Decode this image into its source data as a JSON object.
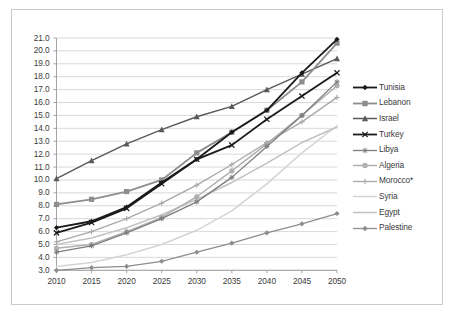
{
  "chart_data": {
    "type": "line",
    "title": "",
    "xlabel": "",
    "ylabel": "",
    "x": [
      2010,
      2015,
      2020,
      2025,
      2030,
      2035,
      2040,
      2045,
      2050
    ],
    "xtick_labels": [
      "2010",
      "2015",
      "2020",
      "2025",
      "2030",
      "2035",
      "2040",
      "2045",
      "2050"
    ],
    "ytick_labels": [
      "3.0",
      "4.0",
      "5.0",
      "6.0",
      "7.0",
      "8.0",
      "9.0",
      "10.0",
      "11.0",
      "12.0",
      "13.0",
      "14.0",
      "15.0",
      "16.0",
      "17.0",
      "18.0",
      "19.0",
      "20.0",
      "21.0"
    ],
    "ylim": [
      3.0,
      21.0
    ],
    "ytick_step": 1.0,
    "grid": "horizontal",
    "legend_position": "right",
    "series": [
      {
        "name": "Tunisia",
        "marker": "diamond",
        "color": "#1a1a1a",
        "width": 1.8,
        "values": [
          6.3,
          6.8,
          7.9,
          9.8,
          11.6,
          13.7,
          15.4,
          18.3,
          20.9
        ]
      },
      {
        "name": "Lebanon",
        "marker": "square",
        "color": "#8d8d8d",
        "width": 1.8,
        "values": [
          8.1,
          8.5,
          9.1,
          10.0,
          12.1,
          13.7,
          15.4,
          17.6,
          20.6
        ]
      },
      {
        "name": "Israel",
        "marker": "triangle",
        "color": "#5a5a5a",
        "width": 1.5,
        "values": [
          10.1,
          11.5,
          12.8,
          13.9,
          14.9,
          15.7,
          17.0,
          18.2,
          19.4
        ]
      },
      {
        "name": "Turkey",
        "marker": "cross",
        "color": "#1a1a1a",
        "width": 1.8,
        "values": [
          5.9,
          6.7,
          7.8,
          9.7,
          11.6,
          12.7,
          14.7,
          16.5,
          18.3
        ]
      },
      {
        "name": "Libya",
        "marker": "star",
        "color": "#7d7d7d",
        "width": 1.3,
        "values": [
          4.4,
          4.9,
          5.9,
          7.0,
          8.3,
          10.2,
          12.6,
          15.0,
          17.6
        ]
      },
      {
        "name": "Algeria",
        "marker": "circle",
        "color": "#b0b0b0",
        "width": 1.5,
        "values": [
          4.7,
          5.0,
          6.0,
          7.1,
          8.7,
          10.7,
          12.8,
          15.0,
          17.3
        ]
      },
      {
        "name": "Morocco*",
        "marker": "plus",
        "color": "#a8a8a8",
        "width": 1.3,
        "values": [
          5.2,
          6.0,
          7.0,
          8.2,
          9.6,
          11.2,
          12.9,
          14.5,
          16.4
        ]
      },
      {
        "name": "Syria",
        "marker": "none",
        "color": "#d4d4d4",
        "width": 1.5,
        "values": [
          3.3,
          3.6,
          4.2,
          5.0,
          6.1,
          7.6,
          9.7,
          12.1,
          14.2
        ]
      },
      {
        "name": "Egypt",
        "marker": "none",
        "color": "#c2c2c2",
        "width": 1.5,
        "values": [
          5.0,
          5.5,
          6.3,
          7.3,
          8.5,
          9.8,
          11.3,
          12.9,
          14.1
        ]
      },
      {
        "name": "Palestine",
        "marker": "diamond",
        "color": "#8d8d8d",
        "width": 1.3,
        "values": [
          3.0,
          3.2,
          3.3,
          3.7,
          4.4,
          5.1,
          5.9,
          6.6,
          7.4
        ]
      }
    ]
  },
  "legend": {
    "items": [
      "Tunisia",
      "Lebanon",
      "Israel",
      "Turkey",
      "Libya",
      "Algeria",
      "Morocco*",
      "Syria",
      "Egypt",
      "Palestine"
    ]
  },
  "colors": {
    "plot_background": "#ffffff",
    "gridline": "#c9c9c9",
    "axis": "#9a9a9a",
    "frame_border": "#c9c9c9",
    "tick_text": "#3a3a3a"
  }
}
